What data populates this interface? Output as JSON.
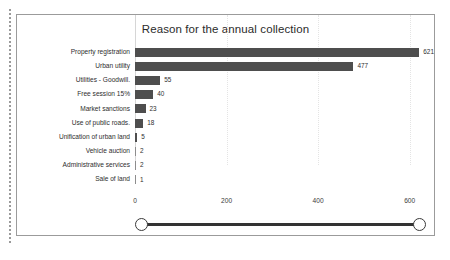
{
  "chart_data": {
    "type": "bar",
    "orientation": "horizontal",
    "title": "Reason for the annual collection",
    "xlabel": "",
    "ylabel": "",
    "categories": [
      "Property registration",
      "Urban utility",
      "Utilities - Goodwill.",
      "Free session 15%",
      "Market sanctions",
      "Use of public roads.",
      "Unification of urban land",
      "Vehicle auction",
      "Administrative services",
      "Sale of land"
    ],
    "values": [
      621,
      477,
      55,
      40,
      23,
      18,
      5,
      2,
      2,
      1
    ],
    "value_labels": [
      "621",
      "477",
      "55",
      "40",
      "23",
      "18",
      "5",
      "2",
      "2",
      "1"
    ],
    "xlim": [
      0,
      640
    ],
    "xticks": [
      0,
      200,
      400,
      600
    ],
    "xtick_labels": [
      "0",
      "200",
      "400",
      "600"
    ],
    "grid": true,
    "grid_axis": "x",
    "legend": false,
    "bar_color": "#4e4e4e",
    "background_color": "#ffffff",
    "text_color": "#2e2e2e"
  },
  "slider": {
    "name": "horizontal-range-slider",
    "left_handle": "range-start-handle",
    "right_handle": "range-end-handle"
  }
}
